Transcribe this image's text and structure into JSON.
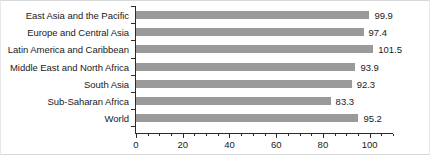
{
  "chart_data": {
    "type": "bar",
    "orientation": "horizontal",
    "title": "",
    "xlabel": "",
    "ylabel": "",
    "categories": [
      "East Asia and the Pacific",
      "Europe and Central Asia",
      "Latin America and Caribbean",
      "Middle East and North Africa",
      "South Asia",
      "Sub-Saharan Africa",
      "World"
    ],
    "values": [
      99.9,
      97.4,
      101.5,
      93.9,
      92.3,
      83.3,
      95.2
    ],
    "value_labels": [
      "99.9",
      "97.4",
      "101.5",
      "93.9",
      "92.3",
      "83.3",
      "95.2"
    ],
    "xlim": [
      0,
      110
    ],
    "xticks": [
      0,
      20,
      40,
      60,
      80,
      100
    ],
    "xtick_labels": [
      "0",
      "20",
      "40",
      "60",
      "80",
      "100"
    ],
    "minor_xtick_step": 5,
    "grid": false,
    "legend": null,
    "bar_color": "#9a9a9a",
    "axis_color": "#2b2b2b",
    "text_color": "#1a1a1a",
    "background": "#ffffff"
  }
}
